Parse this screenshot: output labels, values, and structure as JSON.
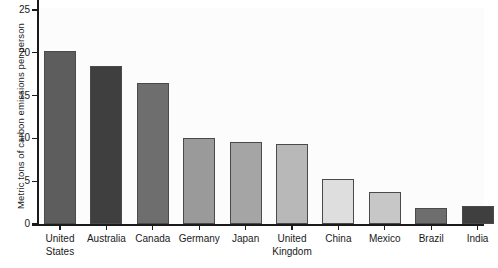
{
  "chart_data": {
    "type": "bar",
    "title": "",
    "subtitle": "",
    "xlabel": "",
    "ylabel": "Metric tons of carbon emissions per person",
    "ylim": [
      0,
      25
    ],
    "ytick_labels": [
      "0",
      "5",
      "10",
      "15",
      "20",
      "25"
    ],
    "ytick_values": [
      0,
      5,
      10,
      15,
      20,
      25
    ],
    "grid": false,
    "legend": "none",
    "categories": [
      "United States",
      "Australia",
      "Canada",
      "Germany",
      "Japan",
      "United Kingdom",
      "China",
      "Mexico",
      "Brazil",
      "India"
    ],
    "category_lines": [
      [
        "United",
        "States"
      ],
      [
        "Australia",
        ""
      ],
      [
        "Canada",
        ""
      ],
      [
        "Germany",
        ""
      ],
      [
        "Japan",
        ""
      ],
      [
        "United",
        "Kingdom"
      ],
      [
        "China",
        ""
      ],
      [
        "Mexico",
        ""
      ],
      [
        "Brazil",
        ""
      ],
      [
        "India",
        ""
      ]
    ],
    "values": [
      20.2,
      18.4,
      16.5,
      10.0,
      9.6,
      9.3,
      5.2,
      3.7,
      1.9,
      2.1
    ],
    "bar_colors": [
      "#5d5d5d",
      "#3f3f3f",
      "#6e6e6e",
      "#9a9a9a",
      "#a5a5a5",
      "#b8b8b8",
      "#dedede",
      "#c7c7c7",
      "#6e6e6e",
      "#3f3f3f"
    ],
    "bar_edge_color": "#4a4a4a",
    "axis_color": "#1a1a1a",
    "plot_background": "#fcfcfc",
    "figure_background": "#ffffff"
  }
}
